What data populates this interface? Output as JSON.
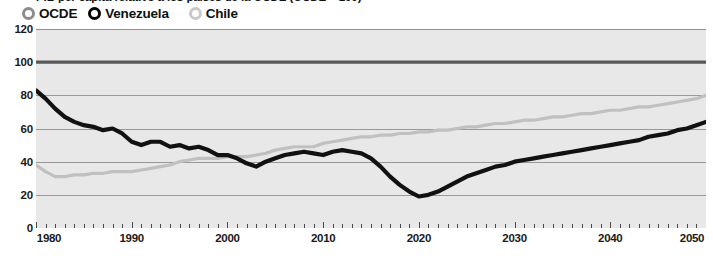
{
  "chart_data": {
    "type": "line",
    "title": "PIB per cápita relativo a los países de la OCDE (OCDE = 100)",
    "xlabel": "",
    "ylabel": "",
    "xlim": [
      1980,
      2050
    ],
    "ylim": [
      0,
      120
    ],
    "grid": true,
    "gridlines_y": [
      0,
      20,
      40,
      60,
      80,
      100,
      120
    ],
    "legend_position": "top-left",
    "y_ticks": [
      "0",
      "20",
      "40",
      "60",
      "80",
      "100",
      "120"
    ],
    "y_tick_values": [
      0,
      20,
      40,
      60,
      80,
      100,
      120
    ],
    "x_ticks": [
      "1980",
      "1990",
      "2000",
      "2010",
      "2020",
      "2030",
      "2040",
      "2050"
    ],
    "x_tick_values": [
      1980,
      1990,
      2000,
      2010,
      2020,
      2030,
      2040,
      2050
    ],
    "x_minor_tick_step": 1,
    "x": [
      1980,
      1981,
      1982,
      1983,
      1984,
      1985,
      1986,
      1987,
      1988,
      1989,
      1990,
      1991,
      1992,
      1993,
      1994,
      1995,
      1996,
      1997,
      1998,
      1999,
      2000,
      2001,
      2002,
      2003,
      2004,
      2005,
      2006,
      2007,
      2008,
      2009,
      2010,
      2011,
      2012,
      2013,
      2014,
      2015,
      2016,
      2017,
      2018,
      2019,
      2020,
      2021,
      2022,
      2023,
      2024,
      2025,
      2026,
      2027,
      2028,
      2029,
      2030,
      2031,
      2032,
      2033,
      2034,
      2035,
      2036,
      2037,
      2038,
      2039,
      2040,
      2041,
      2042,
      2043,
      2044,
      2045,
      2046,
      2047,
      2048,
      2049,
      2050
    ],
    "series": [
      {
        "name": "OCDE",
        "color": "#58585a",
        "style": "reference-line",
        "constant_value": 100,
        "values": [
          100,
          100,
          100,
          100,
          100,
          100,
          100,
          100,
          100,
          100,
          100,
          100,
          100,
          100,
          100,
          100,
          100,
          100,
          100,
          100,
          100,
          100,
          100,
          100,
          100,
          100,
          100,
          100,
          100,
          100,
          100,
          100,
          100,
          100,
          100,
          100,
          100,
          100,
          100,
          100,
          100,
          100,
          100,
          100,
          100,
          100,
          100,
          100,
          100,
          100,
          100,
          100,
          100,
          100,
          100,
          100,
          100,
          100,
          100,
          100,
          100,
          100,
          100,
          100,
          100,
          100,
          100,
          100,
          100,
          100,
          100
        ]
      },
      {
        "name": "Venezuela",
        "color": "#111111",
        "style": "thick",
        "values": [
          83,
          78,
          72,
          67,
          64,
          62,
          61,
          59,
          60,
          57,
          52,
          50,
          52,
          52,
          49,
          50,
          48,
          49,
          47,
          44,
          44,
          42,
          39,
          37,
          40,
          42,
          44,
          45,
          46,
          45,
          44,
          46,
          47,
          46,
          45,
          42,
          37,
          31,
          26,
          22,
          19,
          20,
          22,
          25,
          28,
          31,
          33,
          35,
          37,
          38,
          40,
          41,
          42,
          43,
          44,
          45,
          46,
          47,
          48,
          49,
          50,
          51,
          52,
          53,
          55,
          56,
          57,
          59,
          60,
          62,
          64
        ]
      },
      {
        "name": "Chile",
        "color": "#c0c0c0",
        "style": "thin",
        "values": [
          38,
          34,
          31,
          31,
          32,
          32,
          33,
          33,
          34,
          34,
          34,
          35,
          36,
          37,
          38,
          40,
          41,
          42,
          42,
          42,
          43,
          43,
          43,
          44,
          45,
          47,
          48,
          49,
          49,
          49,
          51,
          52,
          53,
          54,
          55,
          55,
          56,
          56,
          57,
          57,
          58,
          58,
          59,
          59,
          60,
          61,
          61,
          62,
          63,
          63,
          64,
          65,
          65,
          66,
          67,
          67,
          68,
          69,
          69,
          70,
          71,
          71,
          72,
          73,
          73,
          74,
          75,
          76,
          77,
          78,
          80
        ]
      }
    ],
    "legend": [
      {
        "label": "OCDE",
        "marker": "donut",
        "color": "#8c8c8c"
      },
      {
        "label": "Venezuela",
        "marker": "donut",
        "color": "#000000"
      },
      {
        "label": "Chile",
        "marker": "donut",
        "color": "#c9c9c9"
      }
    ],
    "colors": {
      "plot_background": "#e8e8e8",
      "page_background": "#ffffff",
      "gridline": "#8f8f8f",
      "axis_text": "#1a1a1a",
      "ocde_line": "#58585a",
      "venezuela_line": "#111111",
      "chile_line": "#c0c0c0"
    }
  }
}
